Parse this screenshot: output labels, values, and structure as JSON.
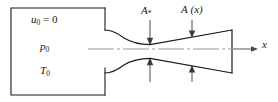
{
  "figure": {
    "colors": {
      "line": "#1a1a1a",
      "centerline": "#9a9a9a",
      "background": "#ffffff"
    }
  },
  "labels": {
    "reservoir_velocity": {
      "symbol": "u",
      "subscript": "0",
      "operator": "=",
      "value": "0",
      "text": "u0 = 0"
    },
    "reservoir_pressure": {
      "symbol": "p",
      "subscript": "0",
      "text": "p0"
    },
    "reservoir_temperature": {
      "symbol": "T",
      "subscript": "0",
      "text": "T0"
    },
    "throat_area": {
      "symbol": "A",
      "subscript": "*",
      "text": "A*"
    },
    "local_area": {
      "symbol": "A",
      "argument": "(x)",
      "text": "A (x)"
    },
    "axis": {
      "symbol": "x",
      "text": "x"
    }
  },
  "geometry": {
    "reservoir_box": {
      "x": 11,
      "y": 8,
      "width": 94,
      "height": 87
    },
    "centerline_y": 49,
    "throat_x": 150,
    "throat_half_height": 6,
    "exit_plane_x": 232,
    "exit_half_height": 19,
    "axis_arrow_end_x": 258
  },
  "annotations": {
    "throat_arrow": {
      "name": "A*",
      "x": 150,
      "points_to": "throat"
    },
    "area_arrow": {
      "name": "A (x)",
      "x": 192,
      "points_to": "diverging-wall"
    }
  }
}
